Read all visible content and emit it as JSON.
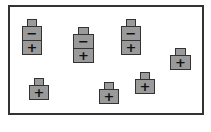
{
  "diagram": {
    "colors": {
      "particle_fill": "#9a9a9a",
      "outline": "#333333",
      "background": "#ffffff"
    },
    "particles": [
      {
        "type": "pair",
        "x": 22,
        "y": 19,
        "w": 20,
        "top_sign": "−",
        "bottom_sign": "+"
      },
      {
        "type": "pair",
        "x": 73,
        "y": 27,
        "w": 21,
        "top_sign": "−",
        "bottom_sign": "+"
      },
      {
        "type": "pair",
        "x": 121,
        "y": 19,
        "w": 20,
        "top_sign": "−",
        "bottom_sign": "+"
      },
      {
        "type": "single",
        "x": 170,
        "y": 48,
        "w": 21,
        "sign": "+"
      },
      {
        "type": "single",
        "x": 29,
        "y": 78,
        "w": 20,
        "sign": "+"
      },
      {
        "type": "single",
        "x": 99,
        "y": 82,
        "w": 20,
        "sign": "+"
      },
      {
        "type": "single",
        "x": 135,
        "y": 72,
        "w": 20,
        "sign": "+"
      }
    ]
  }
}
